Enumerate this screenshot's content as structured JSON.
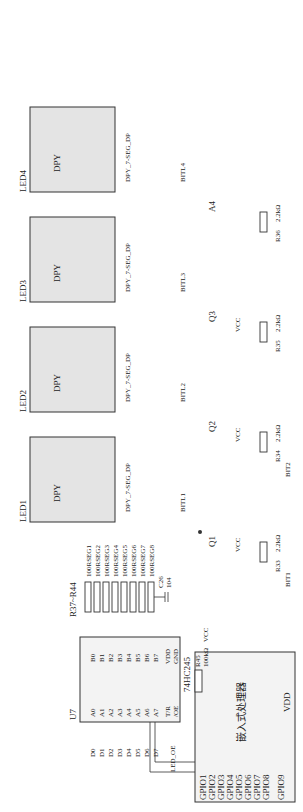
{
  "processor": {
    "label": "嵌入式处理器",
    "pins_left": [
      "GPIO1",
      "GPIO2",
      "GPIO3",
      "GPIO4",
      "GPIO5",
      "GPIO6",
      "GPIO7",
      "GPIO8",
      "GPIO9"
    ],
    "pins_bottom": [
      "VDD",
      "GPIO10",
      "GPIO11",
      "GPIO12",
      "GPIO13",
      "GND"
    ]
  },
  "data_nets": [
    "D0",
    "D1",
    "D2",
    "D3",
    "D4",
    "D5",
    "D6",
    "D7",
    "LED_OE"
  ],
  "buffer": {
    "ref": "U7",
    "part": "74HC245",
    "a_pins": [
      "A0",
      "A1",
      "A2",
      "A3",
      "A4",
      "A5",
      "A6",
      "A7"
    ],
    "a_nums": [
      "2",
      "3",
      "4",
      "5",
      "6",
      "7",
      "8",
      "9"
    ],
    "b_pins": [
      "B0",
      "B1",
      "B2",
      "B3",
      "B4",
      "B5",
      "B6",
      "B7"
    ],
    "b_nums": [
      "18",
      "17",
      "16",
      "15",
      "14",
      "13",
      "12",
      "11"
    ],
    "ctrl_pins": [
      "T/R",
      "/OE"
    ],
    "ctrl_nums": [
      "1",
      "19"
    ],
    "pwr_pins": [
      "VDD",
      "GND"
    ],
    "pwr_nums": [
      "20",
      "10"
    ]
  },
  "pullup": {
    "ref": "R45",
    "value": "100kΩ",
    "net": "VCC"
  },
  "vcc_label": "VCC",
  "cap": {
    "ref": "C26",
    "value": "104"
  },
  "seg_resistors": {
    "ref": "R37~R44",
    "labels": [
      "100RSEG1",
      "100RSEG2",
      "100RSEG3",
      "100RSEG4",
      "100RSEG5",
      "100RSEG6",
      "100RSEG7",
      "100RSEG8"
    ]
  },
  "displays": [
    {
      "ref": "LED1",
      "type": "DPY_7-SEG_DP",
      "name": "DPY"
    },
    {
      "ref": "LED2",
      "type": "DPY_7-SEG_DP",
      "name": "DPY"
    },
    {
      "ref": "LED3",
      "type": "DPY_7-SEG_DP",
      "name": "DPY"
    },
    {
      "ref": "LED4",
      "type": "DPY_7-SEG_DP",
      "name": "DPY"
    }
  ],
  "seg_pins": [
    "a",
    "b",
    "c",
    "d",
    "e",
    "f",
    "g",
    "dp"
  ],
  "seg_nums": [
    "1",
    "2",
    "3",
    "4",
    "5",
    "6",
    "7",
    "8"
  ],
  "transistors": [
    {
      "ref": "Q1",
      "part": "8550",
      "supply": "VCC",
      "net": "BITL1",
      "res": "R33",
      "res_value": "2.2kΩ",
      "bit": "BIT1"
    },
    {
      "ref": "Q2",
      "part": "8550",
      "supply": "VCC",
      "net": "BITL2",
      "res": "R34",
      "res_value": "2.2kΩ",
      "bit": "BIT2"
    },
    {
      "ref": "Q3",
      "part": "8550",
      "supply": "VCC",
      "net": "BITL3",
      "res": "R35",
      "res_value": "2.2kΩ",
      "bit": ""
    },
    {
      "ref": "A4",
      "part": "8550",
      "supply": "",
      "net": "BITL4",
      "res": "R36",
      "res_value": "2.2kΩ",
      "bit": ""
    }
  ]
}
